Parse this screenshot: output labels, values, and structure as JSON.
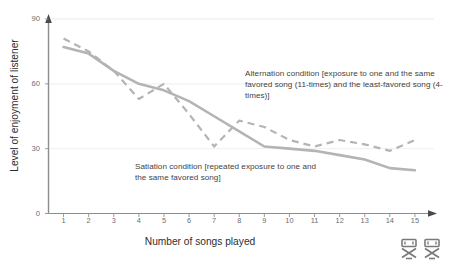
{
  "chart_data": {
    "type": "line",
    "title": "",
    "xlabel": "Number of songs played",
    "ylabel": "Level of enjoyment of listener",
    "x": [
      1,
      2,
      3,
      4,
      5,
      6,
      7,
      8,
      9,
      10,
      11,
      12,
      13,
      14,
      15
    ],
    "xticks": [
      "1",
      "2",
      "3",
      "4",
      "5",
      "6",
      "7",
      "8",
      "9",
      "10",
      "11",
      "12",
      "13",
      "14",
      "15"
    ],
    "yticks": [
      "0",
      "30",
      "60",
      "90"
    ],
    "ytick_values": [
      0,
      30,
      60,
      90
    ],
    "xlim": [
      0.4,
      15.6
    ],
    "ylim": [
      0,
      90
    ],
    "grid": "horizontal",
    "legend": "none (inline annotations)",
    "series": [
      {
        "name": "Satiation condition",
        "style": "solid",
        "color": "#b4b4b4",
        "values": [
          77,
          74,
          66,
          60,
          57,
          52,
          45,
          38,
          31,
          30,
          29,
          27,
          25,
          21,
          20
        ]
      },
      {
        "name": "Alternation condition",
        "style": "dashed",
        "color": "#b4b4b4",
        "values": [
          81,
          75,
          66,
          53,
          60,
          46,
          31,
          43,
          40,
          34,
          31,
          34,
          32,
          29,
          34
        ]
      }
    ],
    "annotations": [
      {
        "id": "alternation",
        "text": "Alternation condition [exposure to one and the same favored song (11-times) and the least-favored song (4-times)]"
      },
      {
        "id": "satiation",
        "text": "Satiation condition [repeated exposure to one and the same favored song]"
      }
    ],
    "axis_color": "#8c8c8c",
    "grid_color": "#f2f2f2"
  }
}
